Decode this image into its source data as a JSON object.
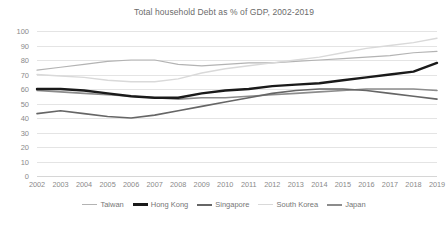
{
  "chart_data": {
    "type": "line",
    "title": "Total household Debt as % of GDP, 2002-2019",
    "xlabel": "",
    "ylabel": "",
    "ylim": [
      0,
      100
    ],
    "ytick_step": 10,
    "yticks": [
      100,
      90,
      80,
      70,
      60,
      50,
      40,
      30,
      20,
      10,
      0
    ],
    "grid": true,
    "legend_position": "bottom",
    "x": [
      2002,
      2003,
      2004,
      2005,
      2006,
      2007,
      2008,
      2009,
      2010,
      2011,
      2012,
      2013,
      2014,
      2015,
      2016,
      2017,
      2018,
      2019
    ],
    "categories": [
      "2002",
      "2003",
      "2004",
      "2005",
      "2006",
      "2007",
      "2008",
      "2009",
      "2010",
      "2011",
      "2012",
      "2013",
      "2014",
      "2015",
      "2016",
      "2017",
      "2018",
      "2019"
    ],
    "series": [
      {
        "name": "Taiwan",
        "color": "#b3b3b3",
        "width": 1.2,
        "values": [
          73,
          75,
          77,
          79,
          80,
          80,
          77,
          76,
          77,
          78,
          78,
          79,
          80,
          81,
          82,
          83,
          85,
          86
        ]
      },
      {
        "name": "Hong Kong",
        "color": "#1a1a1a",
        "width": 2.4,
        "values": [
          60,
          60,
          59,
          57,
          55,
          54,
          54,
          57,
          59,
          60,
          62,
          63,
          64,
          66,
          68,
          70,
          72,
          78
        ]
      },
      {
        "name": "Singapore",
        "color": "#666666",
        "width": 1.6,
        "values": [
          43,
          45,
          43,
          41,
          40,
          42,
          45,
          48,
          51,
          54,
          57,
          59,
          60,
          60,
          59,
          57,
          55,
          53
        ]
      },
      {
        "name": "South Korea",
        "color": "#d9d9d9",
        "width": 1.4,
        "values": [
          70,
          69,
          68,
          66,
          65,
          65,
          67,
          71,
          74,
          76,
          78,
          80,
          82,
          85,
          88,
          90,
          92,
          95
        ]
      },
      {
        "name": "Japan",
        "color": "#8c8c8c",
        "width": 1.6,
        "values": [
          59,
          58,
          57,
          56,
          55,
          54,
          53,
          54,
          54,
          55,
          56,
          57,
          58,
          59,
          60,
          60,
          60,
          59
        ]
      }
    ]
  },
  "legend": {
    "items": [
      {
        "label": "Taiwan",
        "color": "#b3b3b3",
        "width": 1.6
      },
      {
        "label": "Hong Kong",
        "color": "#1a1a1a",
        "width": 3
      },
      {
        "label": "Singapore",
        "color": "#666666",
        "width": 2.2
      },
      {
        "label": "South Korea",
        "color": "#d9d9d9",
        "width": 1.8
      },
      {
        "label": "Japan",
        "color": "#8c8c8c",
        "width": 2.2
      }
    ]
  }
}
